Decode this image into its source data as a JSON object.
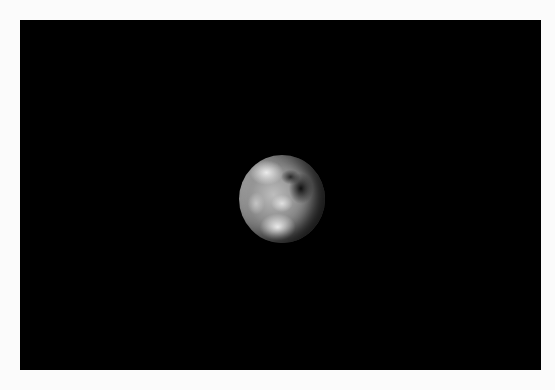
{
  "image": {
    "subject": "Earth viewed from space",
    "background_color": "#000000",
    "border_color": "#fbfbfb"
  }
}
